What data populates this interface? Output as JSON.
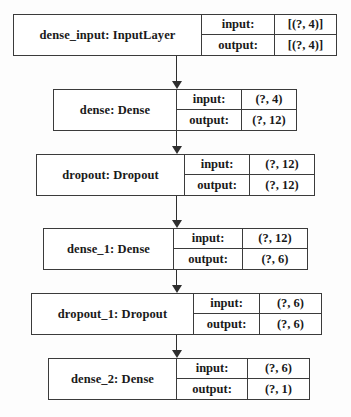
{
  "diagram": {
    "io_labels": {
      "input": "input:",
      "output": "output:"
    },
    "colors": {
      "border": "#3b3b3b",
      "edge": "#2e2e2e",
      "background": "#fdfdfd",
      "text": "#1a1a1a"
    },
    "nodes": [
      {
        "id": "dense_input",
        "name": "dense_input: InputLayer",
        "input": "[(?, 4)]",
        "output": "[(?, 4)]",
        "x": 13,
        "y": 14,
        "w": 324,
        "h": 42,
        "name_w": 187,
        "label_w": 72
      },
      {
        "id": "dense",
        "name": "dense: Dense",
        "input": "(?, 4)",
        "output": "(?, 12)",
        "x": 53,
        "y": 89,
        "w": 244,
        "h": 42,
        "name_w": 122,
        "label_w": 64
      },
      {
        "id": "dropout",
        "name": "dropout: Dropout",
        "input": "(?, 12)",
        "output": "(?, 12)",
        "x": 36,
        "y": 154,
        "w": 279,
        "h": 42,
        "name_w": 147,
        "label_w": 64
      },
      {
        "id": "dense_1",
        "name": "dense_1: Dense",
        "input": "(?, 12)",
        "output": "(?, 6)",
        "x": 43,
        "y": 228,
        "w": 265,
        "h": 42,
        "name_w": 129,
        "label_w": 68
      },
      {
        "id": "dropout_1",
        "name": "dropout_1: Dropout",
        "input": "(?, 6)",
        "output": "(?, 6)",
        "x": 31,
        "y": 293,
        "w": 291,
        "h": 42,
        "name_w": 161,
        "label_w": 65
      },
      {
        "id": "dense_2",
        "name": "dense_2: Dense",
        "input": "(?, 6)",
        "output": "(?, 1)",
        "x": 48,
        "y": 358,
        "w": 262,
        "h": 42,
        "name_w": 127,
        "label_w": 70
      }
    ],
    "edges": [
      {
        "id": "dense_input-to-dense",
        "x": 176,
        "y": 56,
        "h": 25
      },
      {
        "id": "dense-to-dropout",
        "x": 176,
        "y": 131,
        "h": 15
      },
      {
        "id": "dropout-to-dense_1",
        "x": 176,
        "y": 196,
        "h": 24
      },
      {
        "id": "dense_1-to-dropout_1",
        "x": 176,
        "y": 270,
        "h": 15
      },
      {
        "id": "dropout_1-to-dense_2",
        "x": 176,
        "y": 335,
        "h": 15
      }
    ]
  }
}
